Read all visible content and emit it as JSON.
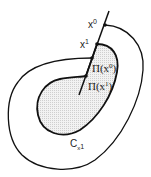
{
  "diagram": {
    "labels": {
      "x0": "x",
      "x0_sup": "0",
      "x1": "x",
      "x1_sup": "1",
      "pi_x0": "Π(x",
      "pi_x0_sup": "0",
      "pi_x0_close": ")",
      "pi_x1": "Π(x",
      "pi_x1_sup": "1",
      "pi_x1_close": ")",
      "c": "C",
      "c_sub": "x",
      "c_subsup": "1"
    },
    "colors": {
      "stroke": "#111111",
      "fill": "#e6e6e6"
    }
  }
}
